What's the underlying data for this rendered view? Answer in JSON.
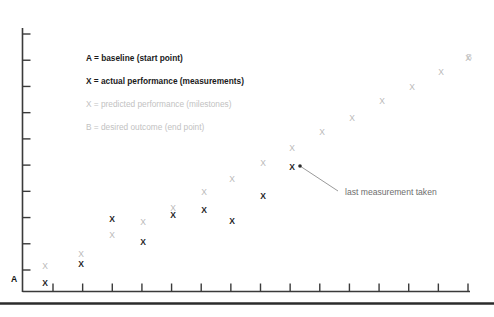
{
  "chart_data": {
    "type": "scatter",
    "title": "",
    "xlabel": "",
    "ylabel": "",
    "grid": false,
    "legend_position": "inside-upper-left",
    "xlim": [
      0,
      15
    ],
    "ylim": [
      0,
      10
    ],
    "axis": {
      "x_tick_count": 15,
      "y_tick_count": 10,
      "baseline_label": "A",
      "endpoint_label": "B"
    },
    "series": [
      {
        "name": "actual performance (measurements)",
        "marker": "X",
        "color": "#1f1f1f",
        "style": "bold",
        "points": [
          {
            "x": 45,
            "y": 283
          },
          {
            "x": 81,
            "y": 264
          },
          {
            "x": 112,
            "y": 219
          },
          {
            "x": 143,
            "y": 242
          },
          {
            "x": 173,
            "y": 215
          },
          {
            "x": 204,
            "y": 210
          },
          {
            "x": 232,
            "y": 221
          },
          {
            "x": 263,
            "y": 196
          },
          {
            "x": 292,
            "y": 167
          }
        ]
      },
      {
        "name": "predicted performance (milestones)",
        "marker": "X",
        "color": "#b9b9b9",
        "style": "light",
        "points": [
          {
            "x": 45,
            "y": 266
          },
          {
            "x": 81,
            "y": 254
          },
          {
            "x": 112,
            "y": 235
          },
          {
            "x": 143,
            "y": 222
          },
          {
            "x": 173,
            "y": 208
          },
          {
            "x": 204,
            "y": 192
          },
          {
            "x": 232,
            "y": 179
          },
          {
            "x": 263,
            "y": 163
          },
          {
            "x": 292,
            "y": 148
          },
          {
            "x": 322,
            "y": 132
          },
          {
            "x": 352,
            "y": 118
          },
          {
            "x": 382,
            "y": 101
          },
          {
            "x": 412,
            "y": 87
          },
          {
            "x": 441,
            "y": 72
          },
          {
            "x": 468,
            "y": 58
          }
        ]
      }
    ],
    "legend_entries": [
      {
        "text": "A = baseline (start point)",
        "emphasis": "bold"
      },
      {
        "text": "X = actual performance (measurements)",
        "emphasis": "bold"
      },
      {
        "text": "X = predicted performance (milestones)",
        "emphasis": "faint"
      },
      {
        "text": "B = desired outcome (end point)",
        "emphasis": "faint"
      }
    ],
    "annotations": [
      {
        "text": "last measurement taken",
        "target_x": 300,
        "target_y": 166,
        "text_x": 345,
        "text_y": 188
      }
    ],
    "colors": {
      "actual": "#1f1f1f",
      "predicted": "#b9b9b9",
      "axis": "#3a3a3a",
      "annotation": "#6e6e6e",
      "background": "#ffffff"
    }
  }
}
